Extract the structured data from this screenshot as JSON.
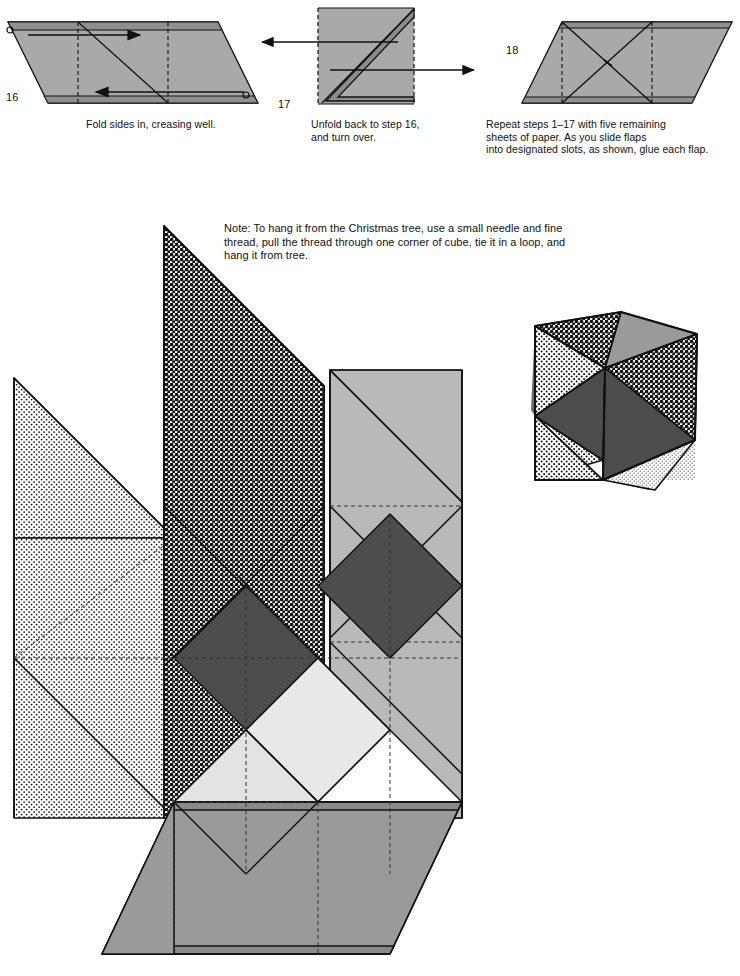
{
  "document": {
    "kind": "origami-instruction-sheet",
    "title": "Modular Cube Ornament – Steps 16 to 18 and Assembly"
  },
  "steps": [
    {
      "id": "step-16",
      "number": "16",
      "caption": "Fold sides in, creasing well.",
      "figure": "parallelogram with two vertical dashed crease lines, diagonal fold line, and two opposing horizontal fold arrows",
      "arrows": [
        "right-pointing arrow on upper half",
        "left-pointing arrow on lower half"
      ]
    },
    {
      "id": "step-17",
      "number": "17",
      "caption": "Unfold back to step 16,\nand turn over.",
      "figure": "square with dashed left and right edges and a Z shaped diagonal fold band",
      "arrows": [
        "left-pointing unfold arrow on upper half",
        "right-pointing unfold arrow on lower half"
      ]
    },
    {
      "id": "step-18",
      "number": "18",
      "caption": "Repeat steps 1–17 with five remaining\nsheets of paper. As you slide flaps\ninto designated slots, as shown, glue each flap.",
      "figure": "parallelogram with two vertical dashed crease lines and crossed diagonal fold lines forming an X in the centre square"
    }
  ],
  "note": {
    "id": "hanging-note",
    "text": "Note: To hang it from the Christmas tree, use a small needle and fine\nthread, pull the thread through one corner of cube, tie it in a loop, and\nhang it from tree."
  },
  "assembly": {
    "id": "assembly-diagram",
    "description": "Large exploded view of six interlocking square modules arranged around a central cube, each module split into triangles with distinct tones."
  },
  "finished_model": {
    "id": "finished-cube",
    "description": "Completed cube ornament shown in three-quarter view with three visible faces, each face divided into four patterned triangles."
  },
  "palette": {
    "dark_gray": "#4c4c4c",
    "mid_gray": "#9a9a9a",
    "light_gray": "#b9b9b9",
    "pale_gray": "#dcdcdc",
    "very_pale": "#e8e8e8",
    "white": "#ffffff",
    "line": "#111111",
    "dashed": "#222222"
  },
  "patterns": [
    {
      "name": "dense-halftone",
      "coverage": "50%",
      "pitch_px": 5
    },
    {
      "name": "sparse-dots",
      "coverage": "12%",
      "pitch_px": 5
    },
    {
      "name": "fine-dots",
      "coverage": "8%",
      "pitch_px": 4
    }
  ]
}
